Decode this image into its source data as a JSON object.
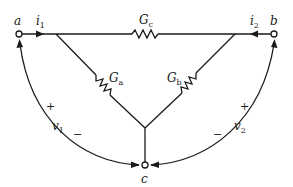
{
  "diagram": {
    "type": "circuit",
    "nodes": {
      "a": {
        "label": "a"
      },
      "b": {
        "label": "b"
      },
      "c": {
        "label": "c"
      }
    },
    "conductances": {
      "Gc": {
        "main": "G",
        "sub": "c"
      },
      "Ga": {
        "main": "G",
        "sub": "a"
      },
      "Gb": {
        "main": "G",
        "sub": "b"
      }
    },
    "currents": {
      "i1": {
        "main": "i",
        "sub": "1"
      },
      "i2": {
        "main": "i",
        "sub": "2"
      }
    },
    "voltages": {
      "v1": {
        "main": "v",
        "sub": "1",
        "plus": "+",
        "minus": "−"
      },
      "v2": {
        "main": "v",
        "sub": "2",
        "plus": "+",
        "minus": "−"
      }
    },
    "colors": {
      "ink": "#1a1a1a",
      "background": "#ffffff"
    }
  }
}
